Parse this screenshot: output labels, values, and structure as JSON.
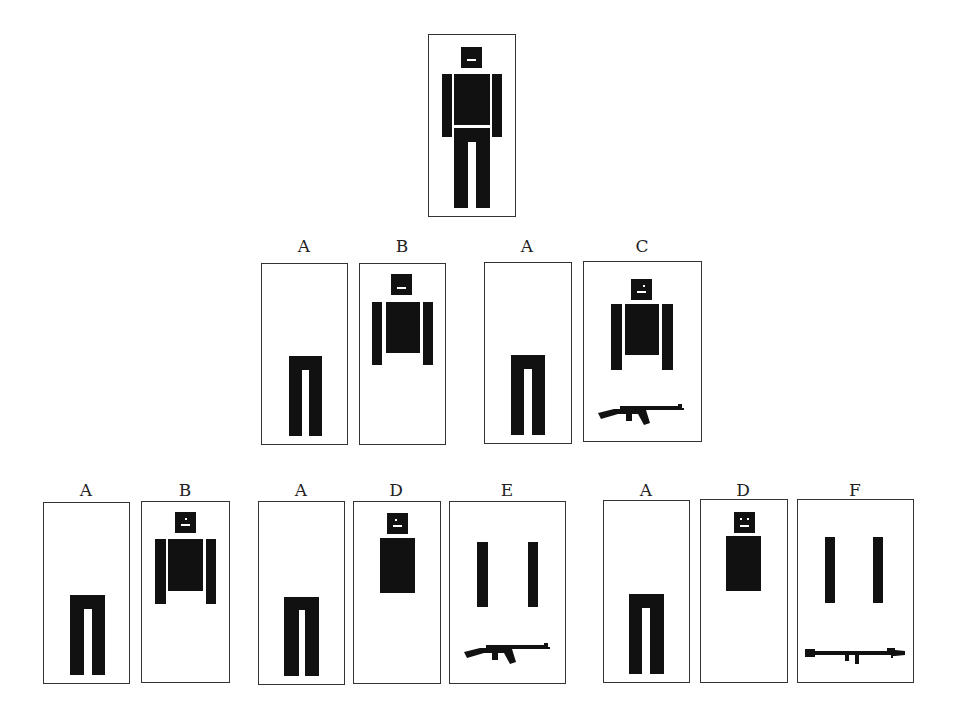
{
  "figure": {
    "type": "decomposition-diagram",
    "top": {
      "label": "",
      "parts": [
        "head",
        "torso",
        "arms",
        "legs"
      ]
    },
    "row2": [
      {
        "label": "A",
        "parts": [
          "legs"
        ]
      },
      {
        "label": "B",
        "parts": [
          "head",
          "torso",
          "arms"
        ]
      },
      {
        "label": "A",
        "parts": [
          "legs"
        ]
      },
      {
        "label": "C",
        "parts": [
          "head",
          "torso",
          "arms",
          "rifle"
        ]
      }
    ],
    "row3": [
      {
        "label": "A",
        "parts": [
          "legs"
        ]
      },
      {
        "label": "B",
        "parts": [
          "head",
          "torso",
          "arms"
        ]
      },
      {
        "label": "A",
        "parts": [
          "legs"
        ]
      },
      {
        "label": "D",
        "parts": [
          "head",
          "torso"
        ]
      },
      {
        "label": "E",
        "parts": [
          "arms",
          "rifle"
        ]
      },
      {
        "label": "A",
        "parts": [
          "legs"
        ]
      },
      {
        "label": "D",
        "parts": [
          "head",
          "torso"
        ]
      },
      {
        "label": "F",
        "parts": [
          "arms",
          "rocket-launcher"
        ]
      }
    ]
  },
  "colors": {
    "ink": "#111111",
    "border": "#333333",
    "background": "#ffffff"
  }
}
